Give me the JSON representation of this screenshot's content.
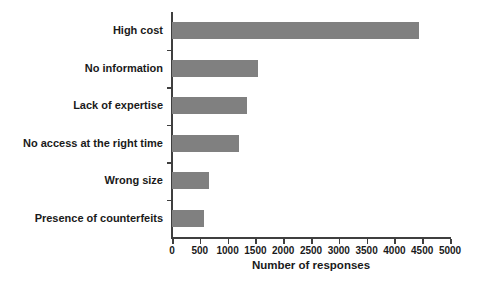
{
  "chart_data": {
    "type": "bar",
    "orientation": "horizontal",
    "title": "",
    "xlabel": "Number of responses",
    "ylabel": "",
    "categories": [
      "High cost",
      "No information",
      "Lack of expertise",
      "No access at the right time",
      "Wrong size",
      "Presence of counterfeits"
    ],
    "values": [
      4450,
      1550,
      1350,
      1200,
      665,
      575
    ],
    "xlim": [
      0,
      5000
    ],
    "xticks": [
      0,
      500,
      1000,
      1500,
      2000,
      2500,
      3000,
      3500,
      4000,
      4500,
      5000
    ],
    "xtick_labels": [
      "0",
      "500",
      "1000",
      "1500",
      "2000",
      "2500",
      "3000",
      "3500",
      "4000",
      "4500",
      "5000"
    ],
    "grid": false,
    "legend": false,
    "bar_color": "#808080",
    "axis_color": "#3f3f3f",
    "background": "#ffffff"
  }
}
